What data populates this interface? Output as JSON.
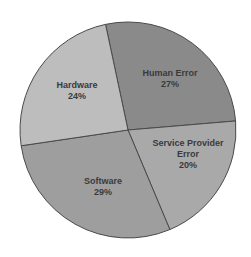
{
  "chart_data": {
    "type": "pie",
    "title": "",
    "center": [
      128,
      130
    ],
    "radius": 108,
    "slices": [
      {
        "label": "Human Error",
        "label_lines": [
          "Human Error"
        ],
        "value": 27,
        "display": "27%",
        "color": "#8a8a8a",
        "label_pos": [
          170,
          68
        ]
      },
      {
        "label": "Service Provider Error",
        "label_lines": [
          "Service Provider",
          "Error"
        ],
        "value": 20,
        "display": "20%",
        "color": "#a9a9a9",
        "label_pos": [
          188,
          138
        ]
      },
      {
        "label": "Software",
        "label_lines": [
          "Software"
        ],
        "value": 29,
        "display": "29%",
        "color": "#9e9e9e",
        "label_pos": [
          103,
          176
        ]
      },
      {
        "label": "Hardware",
        "label_lines": [
          "Hardware"
        ],
        "value": 24,
        "display": "24%",
        "color": "#bdbdbd",
        "label_pos": [
          77,
          80
        ]
      }
    ],
    "start_angle_deg": -102,
    "legend": "none",
    "border_color": "#4a4a4a"
  }
}
